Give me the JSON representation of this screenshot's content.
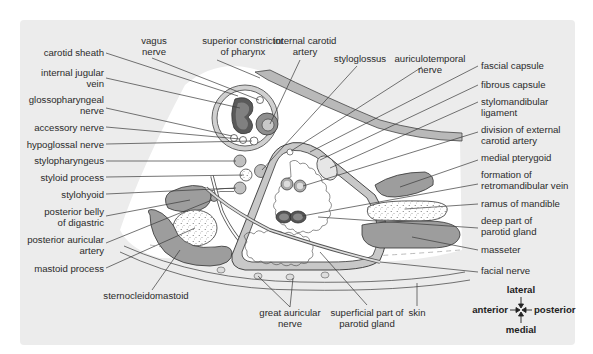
{
  "diagram": {
    "colors": {
      "panel": "#ececec",
      "white_region": "#ffffff",
      "muscle_grey": "#9a9a9a",
      "dark_vessel": "#666666",
      "light_fill": "#d8d8d8",
      "line": "#3a3a3a"
    },
    "labels_left": {
      "carotid_sheath": [
        "carotid sheath"
      ],
      "internal_jugular_vein": [
        "internal jugular",
        "vein"
      ],
      "glossopharyngeal_nerve": [
        "glossopharyngeal",
        "nerve"
      ],
      "accessory_nerve": [
        "accessory nerve"
      ],
      "hypoglossal_nerve": [
        "hypoglossal nerve"
      ],
      "stylopharyngeus": [
        "stylopharyngeus"
      ],
      "styloid_process": [
        "styloid process"
      ],
      "stylohyoid": [
        "stylohyoid"
      ],
      "posterior_belly_of_digastric": [
        "posterior belly",
        "of digastric"
      ],
      "posterior_auricular_artery": [
        "posterior auricular",
        "artery"
      ],
      "mastoid_process": [
        "mastoid process"
      ]
    },
    "labels_top": {
      "vagus_nerve": [
        "vagus",
        "nerve"
      ],
      "superior_constrictor_of_pharynx": [
        "superior constrictor",
        "of pharynx"
      ],
      "internal_carotid_artery": [
        "internal carotid",
        "artery"
      ],
      "styloglossus": [
        "styloglossus"
      ],
      "auriculotemporal_nerve": [
        "auriculotemporal",
        "nerve"
      ]
    },
    "labels_right": {
      "fascial_capsule": [
        "fascial capsule"
      ],
      "fibrous_capsule": [
        "fibrous capsule"
      ],
      "stylomandibular_ligament": [
        "stylomandibular",
        "ligament"
      ],
      "division_of_external_carotid_artery": [
        "division of external",
        "carotid artery"
      ],
      "medial_pterygoid": [
        "medial pterygoid"
      ],
      "formation_of_retromandibular_vein": [
        "formation of",
        "retromandibular vein"
      ],
      "ramus_of_mandible": [
        "ramus of mandible"
      ],
      "deep_part_of_parotid_gland": [
        "deep part of",
        "parotid gland"
      ],
      "masseter": [
        "masseter"
      ],
      "facial_nerve": [
        "facial nerve"
      ]
    },
    "labels_bottom": {
      "sternocleidomastoid": [
        "sternocleidomastoid"
      ],
      "great_auricular_nerve": [
        "great auricular",
        "nerve"
      ],
      "superficial_part_of_parotid_gland": [
        "superficial part of",
        "parotid gland"
      ],
      "skin": [
        "skin"
      ]
    },
    "orientation": {
      "lateral": "lateral",
      "medial": "medial",
      "anterior": "anterior",
      "posterior": "posterior"
    }
  }
}
